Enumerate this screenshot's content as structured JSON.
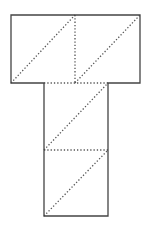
{
  "diagram": {
    "title": "",
    "colors": {
      "solid_line": "#444444",
      "dotted_line": "#555555",
      "background": "#ffffff"
    },
    "outline_points": "11,15 140,15 140,83 108,83 108,216 44,216 44,83 11,83",
    "fold_lines": [
      {
        "x1": 75,
        "y1": 15,
        "x2": 75,
        "y2": 83
      },
      {
        "x1": 44,
        "y1": 83,
        "x2": 108,
        "y2": 83
      },
      {
        "x1": 44,
        "y1": 150,
        "x2": 108,
        "y2": 150
      }
    ],
    "diagonals": [
      {
        "x1": 11,
        "y1": 83,
        "x2": 75,
        "y2": 15
      },
      {
        "x1": 75,
        "y1": 83,
        "x2": 140,
        "y2": 15
      },
      {
        "x1": 44,
        "y1": 150,
        "x2": 108,
        "y2": 83
      },
      {
        "x1": 44,
        "y1": 216,
        "x2": 108,
        "y2": 150
      }
    ]
  }
}
